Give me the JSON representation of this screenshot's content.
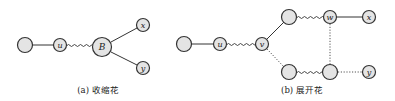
{
  "figure": {
    "panel_a": {
      "caption": "(a) 收缩花",
      "nodes": [
        {
          "id": "p1",
          "label": ""
        },
        {
          "id": "u",
          "label": "u"
        },
        {
          "id": "B",
          "label": "B"
        },
        {
          "id": "x",
          "label": "x"
        },
        {
          "id": "y",
          "label": "y"
        }
      ],
      "edges": [
        {
          "from": "p1",
          "to": "u",
          "style": "solid"
        },
        {
          "from": "u",
          "to": "B",
          "style": "wavy"
        },
        {
          "from": "B",
          "to": "x",
          "style": "solid"
        },
        {
          "from": "B",
          "to": "y",
          "style": "solid"
        }
      ]
    },
    "panel_b": {
      "caption": "(b) 展开花",
      "nodes": [
        {
          "id": "p1",
          "label": ""
        },
        {
          "id": "u",
          "label": "u"
        },
        {
          "id": "v",
          "label": "v"
        },
        {
          "id": "t1",
          "label": ""
        },
        {
          "id": "w",
          "label": "w"
        },
        {
          "id": "x",
          "label": "x"
        },
        {
          "id": "b1",
          "label": ""
        },
        {
          "id": "b2",
          "label": ""
        },
        {
          "id": "y",
          "label": "y"
        }
      ],
      "edges": [
        {
          "from": "p1",
          "to": "u",
          "style": "solid"
        },
        {
          "from": "u",
          "to": "v",
          "style": "wavy"
        },
        {
          "from": "v",
          "to": "t1",
          "style": "solid"
        },
        {
          "from": "t1",
          "to": "w",
          "style": "wavy"
        },
        {
          "from": "w",
          "to": "x",
          "style": "solid"
        },
        {
          "from": "v",
          "to": "b1",
          "style": "dotted"
        },
        {
          "from": "b1",
          "to": "b2",
          "style": "wavy"
        },
        {
          "from": "w",
          "to": "b2",
          "style": "dotted"
        },
        {
          "from": "b2",
          "to": "y",
          "style": "dotted"
        }
      ]
    }
  }
}
